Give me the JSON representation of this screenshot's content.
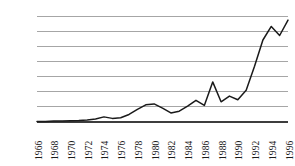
{
  "chart_data": {
    "type": "line",
    "title": "",
    "subtitle": "",
    "xlabel": "",
    "ylabel": "",
    "grid": true,
    "legend": false,
    "legend_position": "none",
    "line_color": "#1a1a1a",
    "grid_color": "#a6a6a6",
    "axis_color": "#3d3d3d",
    "background_color": "#ffffff",
    "xlim": [
      1966,
      1996
    ],
    "ylim": [
      0,
      3.5
    ],
    "ytick_labels": [
      "3.50",
      "3.00",
      "2.50",
      "2.00",
      "1.50",
      "1.00",
      "0.50",
      "0"
    ],
    "ytick_values": [
      3.5,
      3.0,
      2.5,
      2.0,
      1.5,
      1.0,
      0.5,
      0
    ],
    "xtick_labels": [
      "1966",
      "1968",
      "1970",
      "1972",
      "1974",
      "1976",
      "1978",
      "1980",
      "1982",
      "1984",
      "1986",
      "1988",
      "1990",
      "1992",
      "1994",
      "1996"
    ],
    "xtick_values": [
      1966,
      1968,
      1970,
      1972,
      1974,
      1976,
      1978,
      1980,
      1982,
      1984,
      1986,
      1988,
      1990,
      1992,
      1994,
      1996
    ],
    "x": [
      1966,
      1967,
      1968,
      1969,
      1970,
      1971,
      1972,
      1973,
      1974,
      1975,
      1976,
      1977,
      1978,
      1979,
      1980,
      1981,
      1982,
      1983,
      1984,
      1985,
      1986,
      1987,
      1988,
      1989,
      1990,
      1991,
      1992,
      1993,
      1994,
      1995,
      1996
    ],
    "values": [
      0.02,
      0.02,
      0.03,
      0.03,
      0.04,
      0.05,
      0.07,
      0.1,
      0.17,
      0.12,
      0.14,
      0.25,
      0.42,
      0.57,
      0.6,
      0.46,
      0.3,
      0.36,
      0.53,
      0.72,
      0.55,
      1.33,
      0.67,
      0.86,
      0.74,
      1.05,
      1.85,
      2.72,
      3.17,
      2.87,
      3.38
    ],
    "series": [
      {
        "name": "series-1",
        "values": [
          0.02,
          0.02,
          0.03,
          0.03,
          0.04,
          0.05,
          0.07,
          0.1,
          0.17,
          0.12,
          0.14,
          0.25,
          0.42,
          0.57,
          0.6,
          0.46,
          0.3,
          0.36,
          0.53,
          0.72,
          0.55,
          1.33,
          0.67,
          0.86,
          0.74,
          1.05,
          1.85,
          2.72,
          3.17,
          2.87,
          3.38
        ]
      }
    ]
  }
}
